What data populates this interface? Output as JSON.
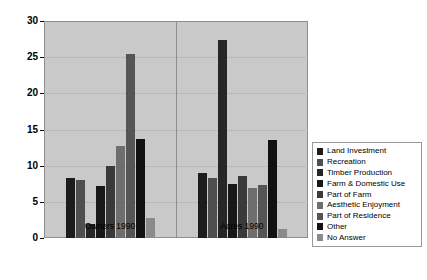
{
  "chart_data": {
    "type": "bar",
    "title": "",
    "xlabel": "",
    "ylabel": "",
    "ylim": [
      0,
      30
    ],
    "yticks": [
      0,
      5,
      10,
      15,
      20,
      25,
      30
    ],
    "grid": true,
    "legend_position": "right",
    "categories": [
      "Owners 1990",
      "Acres 1990"
    ],
    "series": [
      {
        "name": "Land Investment",
        "color": "#1c1c1c",
        "values": [
          8.3,
          9.0
        ]
      },
      {
        "name": "Recreation",
        "color": "#4f4f4f",
        "values": [
          8.0,
          8.3
        ]
      },
      {
        "name": "Timber Production",
        "color": "#262626",
        "values": [
          2.0,
          27.4
        ]
      },
      {
        "name": "Farm & Domestic Use",
        "color": "#181818",
        "values": [
          7.2,
          7.5
        ]
      },
      {
        "name": "Part of Farm",
        "color": "#3a3a3a",
        "values": [
          9.9,
          8.6
        ]
      },
      {
        "name": "Aesthetic Enjoyment",
        "color": "#6e6e6e",
        "values": [
          12.7,
          6.9
        ]
      },
      {
        "name": "Part of Residence",
        "color": "#555555",
        "values": [
          25.4,
          7.3
        ]
      },
      {
        "name": "Other",
        "color": "#111111",
        "values": [
          13.7,
          13.6
        ]
      },
      {
        "name": "No Answer",
        "color": "#8a8a8a",
        "values": [
          2.8,
          1.2
        ]
      }
    ]
  },
  "axis": {
    "y_tick_labels": [
      "0",
      "5",
      "10",
      "15",
      "20",
      "25",
      "30"
    ],
    "x_tick_labels": [
      "Owners 1990",
      "Acres 1990"
    ]
  },
  "legend": {
    "items": [
      "Land Investment",
      "Recreation",
      "Timber Production",
      "Farm & Domestic Use",
      "Part of Farm",
      "Aesthetic Enjoyment",
      "Part of Residence",
      "Other",
      "No Answer"
    ]
  },
  "colors": {
    "plot_background": "#c9c9c9",
    "gridline": "#a8a8a8",
    "axis": "#000000",
    "page_background": "#ffffff"
  }
}
